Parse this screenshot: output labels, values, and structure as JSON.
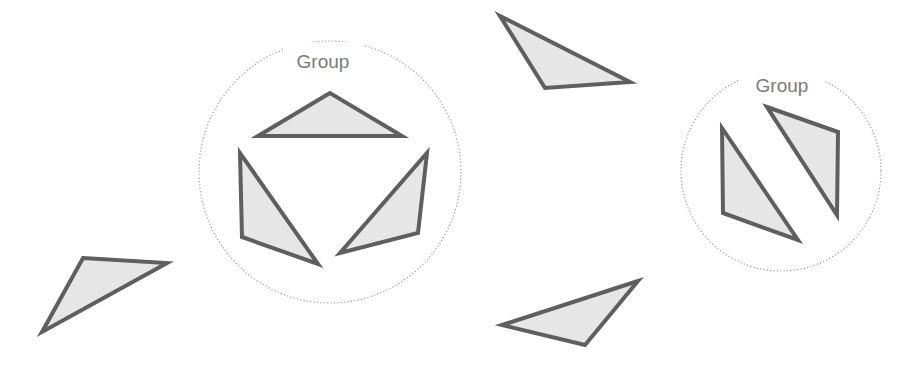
{
  "diagram": {
    "colors": {
      "background": "#ffffff",
      "triangle_fill": "#e6e6e6",
      "triangle_stroke": "#5f5f5f",
      "group_circle": "#9a9a9a",
      "group_label": "#7a7a7a"
    },
    "groups": [
      {
        "label": "Group",
        "circle": {
          "cx": 330,
          "cy": 172,
          "r": 131
        },
        "label_pos": {
          "x": 323,
          "y": 68
        },
        "triangles": [
          {
            "points": "330,93 258,136 402,136"
          },
          {
            "points": "240,153 242,237 318,264"
          },
          {
            "points": "427,153 418,233 340,253"
          }
        ]
      },
      {
        "label": "Group",
        "circle": {
          "cx": 781,
          "cy": 171,
          "r": 100
        },
        "label_pos": {
          "x": 782,
          "y": 92
        },
        "triangles": [
          {
            "points": "722,128 723,213 798,240"
          },
          {
            "points": "767,107 838,132 837,215"
          }
        ]
      }
    ],
    "loose_triangles": [
      {
        "points": "500,16 630,82 545,88"
      },
      {
        "points": "83,258 167,263 42,332"
      },
      {
        "points": "638,281 502,325 585,345"
      }
    ]
  }
}
